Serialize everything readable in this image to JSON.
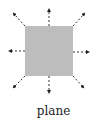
{
  "diagram": {
    "label": "plane",
    "plane_color": "#bdbdbd",
    "arrow_color": "#222222",
    "arrow_directions": [
      "up",
      "down",
      "left",
      "right",
      "up-left",
      "up-right",
      "down-left",
      "down-right"
    ]
  }
}
